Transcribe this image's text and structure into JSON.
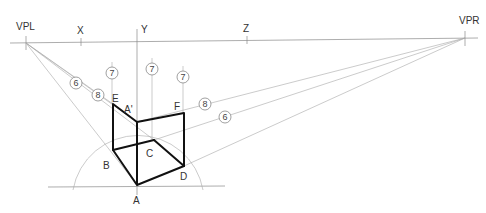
{
  "diagram": {
    "type": "two-point-perspective-construction",
    "vanishing_points": {
      "left": {
        "label": "VPL",
        "x": 26,
        "y": 43
      },
      "right": {
        "label": "VPR",
        "x": 465,
        "y": 38
      }
    },
    "horizon_marks": [
      {
        "label": "X",
        "x": 81
      },
      {
        "label": "Y",
        "x": 137
      },
      {
        "label": "Z",
        "x": 247
      }
    ],
    "points": {
      "A": {
        "label": "A",
        "x": 137,
        "y": 185
      },
      "B": {
        "label": "B",
        "x": 113,
        "y": 150
      },
      "C": {
        "label": "C",
        "x": 154,
        "y": 140
      },
      "D": {
        "label": "D",
        "x": 184,
        "y": 166
      },
      "E": {
        "label": "E",
        "x": 113,
        "y": 104
      },
      "F": {
        "label": "F",
        "x": 183,
        "y": 113
      },
      "A1": {
        "label": "A'",
        "x": 137,
        "y": 122
      }
    },
    "step_markers": [
      {
        "label": "6",
        "x": 76,
        "y": 83
      },
      {
        "label": "8",
        "x": 98,
        "y": 95
      },
      {
        "label": "7",
        "x": 112,
        "y": 73
      },
      {
        "label": "7",
        "x": 152,
        "y": 69
      },
      {
        "label": "7",
        "x": 183,
        "y": 77
      },
      {
        "label": "8",
        "x": 205,
        "y": 104
      },
      {
        "label": "6",
        "x": 225,
        "y": 117
      }
    ]
  }
}
